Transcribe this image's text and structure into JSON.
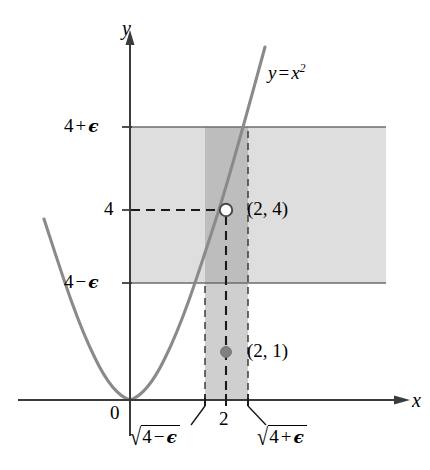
{
  "figure": {
    "kind": "calculus-epsilon-delta-diagram",
    "background_color": "#ffffff"
  },
  "axes": {
    "x_label": "x",
    "y_label": "y",
    "origin_label": "0",
    "axis_color": "#3b3b3b",
    "x_axis_y_px": 400,
    "y_axis_x_px": 130
  },
  "curve": {
    "label": "y = x",
    "label_exponent": "2",
    "equation_plain": "y = x^2",
    "color": "#8a8a8a"
  },
  "ticks": {
    "y": [
      {
        "label": "4 + ",
        "epsilon": true,
        "sign": "+",
        "value_px": 127
      },
      {
        "label": "4",
        "epsilon": false,
        "value_px": 210
      },
      {
        "label": "4 - ",
        "epsilon": true,
        "sign": "−",
        "value_px": 283
      }
    ],
    "x": [
      {
        "label_radicand": "4 − ",
        "label_kind": "sqrt-minus",
        "value_px": 205
      },
      {
        "label": "2",
        "label_kind": "plain",
        "value_px": 226
      },
      {
        "label_radicand": "4 + ",
        "label_kind": "sqrt-plus",
        "value_px": 248
      }
    ]
  },
  "labels": {
    "y_plus_eps": {
      "base": "4",
      "op": "+",
      "eps": "ϵ"
    },
    "y_four": "4",
    "y_minus_eps": {
      "base": "4",
      "op": "−",
      "eps": "ϵ"
    },
    "x_sqrt_minus": {
      "surd": "√",
      "base": "4",
      "op": "−",
      "eps": "ϵ"
    },
    "x_two": "2",
    "x_sqrt_plus": {
      "surd": "√",
      "base": "4",
      "op": "+",
      "eps": "ϵ"
    },
    "origin": "0",
    "x_axis": "x",
    "y_axis": "y",
    "curve_eq_lhs": "y",
    "curve_eq_rel": "=",
    "curve_eq_var": "x",
    "curve_eq_pow": "2"
  },
  "points": [
    {
      "name": "point-2-4",
      "label": "(2, 4)",
      "x_value": 2,
      "y_value": 4,
      "style": "open-circle",
      "fill": "#ffffff",
      "stroke": "#4a4a4a",
      "px": {
        "x": 226,
        "y": 210
      }
    },
    {
      "name": "point-2-1",
      "label": "(2, 1)",
      "x_value": 2,
      "y_value": 1,
      "style": "filled-circle",
      "fill": "#808080",
      "stroke": "#6e6e6e",
      "px": {
        "x": 226,
        "y": 352
      }
    }
  ],
  "regions": [
    {
      "name": "horizontal-epsilon-band",
      "description": "band between 4 - epsilon and 4 + epsilon",
      "color": "#dedede",
      "px": {
        "x": 130,
        "y": 127,
        "w": 256,
        "h": 156
      }
    },
    {
      "name": "vertical-delta-strip-upper",
      "description": "overlap of delta strip with epsilon band",
      "color": "#bdbdbd",
      "px": {
        "x": 205,
        "y": 127,
        "w": 43,
        "h": 156
      }
    },
    {
      "name": "vertical-delta-strip-lower",
      "description": "delta strip below the epsilon band down to x-axis",
      "color": "#cfcfcf",
      "px": {
        "x": 205,
        "y": 283,
        "w": 43,
        "h": 117
      }
    }
  ],
  "guide_lines": [
    {
      "name": "epsilon-upper-line",
      "orientation": "horizontal",
      "style": "solid",
      "color": "#6d6d6d"
    },
    {
      "name": "epsilon-lower-line",
      "orientation": "horizontal",
      "style": "solid",
      "color": "#6d6d6d"
    },
    {
      "name": "y-four-dashed-line",
      "orientation": "horizontal",
      "style": "dashed",
      "color": "#1a1a1a"
    },
    {
      "name": "x-two-dashed-line",
      "orientation": "vertical",
      "style": "dashed",
      "color": "#1a1a1a"
    },
    {
      "name": "sqrt-minus-dashed-line",
      "orientation": "vertical",
      "style": "dashed",
      "color": "#3d3d3d"
    },
    {
      "name": "sqrt-plus-dashed-line",
      "orientation": "vertical",
      "style": "dashed",
      "color": "#3d3d3d"
    }
  ],
  "leader_lines": [
    {
      "name": "leader-sqrt-minus",
      "from_px": {
        "x": 205,
        "y": 404
      },
      "to_px": {
        "x": 192,
        "y": 424
      }
    },
    {
      "name": "leader-sqrt-plus",
      "from_px": {
        "x": 248,
        "y": 404
      },
      "to_px": {
        "x": 266,
        "y": 424
      }
    }
  ]
}
